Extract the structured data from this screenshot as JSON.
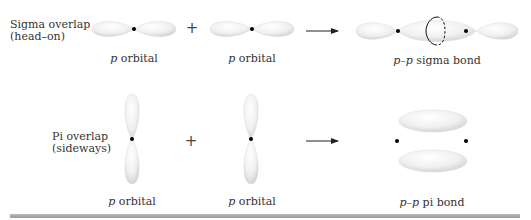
{
  "rows": [
    {
      "label_line1": "Sigma overlap",
      "label_line2": "(head–on)",
      "operator": "+",
      "left_caption_italic": "p",
      "left_caption_rest": " orbital",
      "middle_caption_italic": "p",
      "middle_caption_rest": " orbital",
      "result_caption_italic": "p–p",
      "result_caption_rest": " sigma bond"
    },
    {
      "label_line1": "Pi overlap",
      "label_line2": "(sideways)",
      "operator": "+",
      "left_caption_italic": "p",
      "left_caption_rest": " orbital",
      "middle_caption_italic": "p",
      "middle_caption_rest": " orbital",
      "result_caption_italic": "p–p",
      "result_caption_rest": " pi bond"
    }
  ],
  "colors": {
    "lobe_fill": "#f2f2f2",
    "lobe_shade": "#d6d6d6",
    "nucleus": "#000000",
    "rule": "#a0a0a0"
  }
}
